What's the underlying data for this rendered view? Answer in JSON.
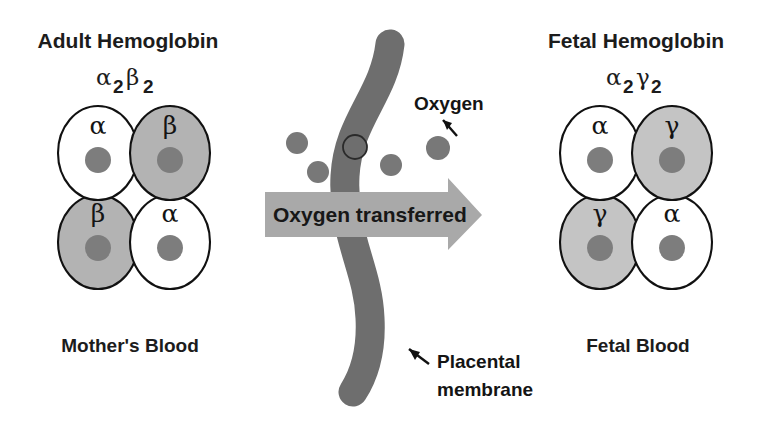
{
  "diagram": {
    "background_color": "#ffffff"
  },
  "left_panel": {
    "heading": "Adult Hemoglobin",
    "formula": {
      "full": "α2β2",
      "part1_greek": "α",
      "part1_sub": "2",
      "part2_greek": "β",
      "part2_sub": "2"
    },
    "blood_label": "Mother's Blood",
    "subunits": [
      {
        "label": "α",
        "position": "top-left",
        "fill": "#ffffff",
        "shaded": false
      },
      {
        "label": "β",
        "position": "top-right",
        "fill": "#b3b3b3",
        "shaded": true
      },
      {
        "label": "β",
        "position": "bottom-left",
        "fill": "#b3b3b3",
        "shaded": true
      },
      {
        "label": "α",
        "position": "bottom-right",
        "fill": "#ffffff",
        "shaded": false
      }
    ],
    "heme_color": "#7d7d7d"
  },
  "right_panel": {
    "heading": "Fetal Hemoglobin",
    "formula": {
      "full": "α2γ2",
      "part1_greek": "α",
      "part1_sub": "2",
      "part2_greek": "γ",
      "part2_sub": "2"
    },
    "blood_label": "Fetal Blood",
    "subunits": [
      {
        "label": "α",
        "position": "top-left",
        "fill": "#ffffff",
        "shaded": false
      },
      {
        "label": "γ",
        "position": "top-right",
        "fill": "#c4c4c4",
        "shaded": true
      },
      {
        "label": "γ",
        "position": "bottom-left",
        "fill": "#c4c4c4",
        "shaded": true
      },
      {
        "label": "α",
        "position": "bottom-right",
        "fill": "#ffffff",
        "shaded": false
      }
    ],
    "heme_color": "#7d7d7d"
  },
  "center": {
    "transfer_band_label": "Oxygen transferred",
    "transfer_band_color": "#a9a9a9",
    "membrane_color": "#6e6e6e",
    "oxygen_label": "Oxygen",
    "oxygen_dot_color": "#787878",
    "oxygen_dots": [
      {
        "id": "o2-1",
        "cx": 297,
        "cy": 143,
        "r": 11,
        "on_membrane": false
      },
      {
        "id": "o2-2",
        "cx": 318,
        "cy": 172,
        "r": 11,
        "on_membrane": false
      },
      {
        "id": "o2-3",
        "cx": 355,
        "cy": 147,
        "r": 12,
        "on_membrane": true
      },
      {
        "id": "o2-4",
        "cx": 391,
        "cy": 165,
        "r": 11,
        "on_membrane": false
      },
      {
        "id": "o2-5",
        "cx": 438,
        "cy": 148,
        "r": 12,
        "on_membrane": false
      }
    ],
    "membrane_label_line1": "Placental",
    "membrane_label_line2": "membrane"
  }
}
